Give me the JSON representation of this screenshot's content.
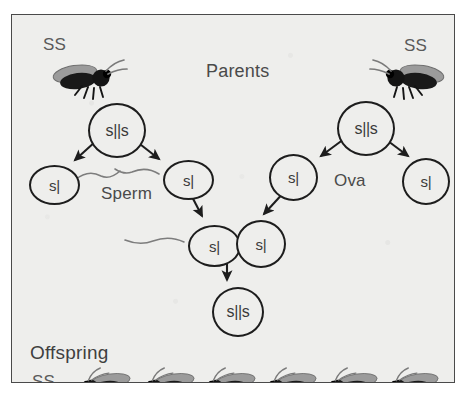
{
  "figure": {
    "title": "Parents",
    "kind": "genetics-inheritance-diagram",
    "organism": "fruit fly"
  },
  "labels": {
    "parents": "Parents",
    "sperm": "Sperm",
    "ova": "Ova",
    "offspring": "Offspring",
    "parent_left_phenotype": "SS",
    "parent_right_phenotype": "SS",
    "offspring_phenotype": "SS"
  },
  "cells": {
    "parent_left_diploid": "s||s",
    "parent_right_diploid": "s||s",
    "sperm_1": "s|",
    "sperm_2": "s|",
    "ovum_1": "s|",
    "ovum_2": "s|",
    "fertilizing_sperm": "s|",
    "fertilizing_ovum": "s|",
    "zygote": "s||s"
  },
  "counts": {
    "offspring_flies": 6,
    "parent_flies": 2,
    "sperm_cells": 2,
    "ova_cells": 2
  },
  "colors": {
    "panel_background": "#eeeeec",
    "panel_border": "#4a4a4a",
    "ink": "#1d1d1d",
    "text": "#4e4e4e",
    "fly_body_dark": "#1a1a1a",
    "fly_wing_gray": "#9a9a9a",
    "page_background": "#ffffff"
  },
  "icons": {
    "fly": "fruit-fly-icon",
    "sperm_tail": "sperm-tail-icon",
    "arrow": "arrow-icon"
  }
}
